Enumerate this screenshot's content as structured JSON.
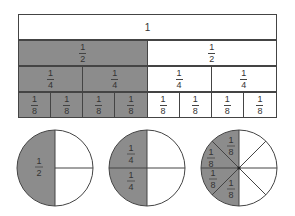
{
  "colors": {
    "shaded": "#8c8c8c",
    "unshaded": "#ffffff",
    "stroke": "#444444",
    "text": "#333333"
  },
  "fraction_bars": {
    "rows": [
      {
        "name": "whole",
        "cells": [
          {
            "label": "1",
            "shaded": false
          }
        ]
      },
      {
        "name": "halves",
        "cells": [
          {
            "num": "1",
            "den": "2",
            "shaded": true
          },
          {
            "num": "1",
            "den": "2",
            "shaded": false
          }
        ]
      },
      {
        "name": "quarters",
        "cells": [
          {
            "num": "1",
            "den": "4",
            "shaded": true
          },
          {
            "num": "1",
            "den": "4",
            "shaded": true
          },
          {
            "num": "1",
            "den": "4",
            "shaded": false
          },
          {
            "num": "1",
            "den": "4",
            "shaded": false
          }
        ]
      },
      {
        "name": "eighths",
        "cells": [
          {
            "num": "1",
            "den": "8",
            "shaded": true
          },
          {
            "num": "1",
            "den": "8",
            "shaded": true
          },
          {
            "num": "1",
            "den": "8",
            "shaded": true
          },
          {
            "num": "1",
            "den": "8",
            "shaded": true
          },
          {
            "num": "1",
            "den": "8",
            "shaded": false
          },
          {
            "num": "1",
            "den": "8",
            "shaded": false
          },
          {
            "num": "1",
            "den": "8",
            "shaded": false
          },
          {
            "num": "1",
            "den": "8",
            "shaded": false
          }
        ]
      }
    ]
  },
  "circles": [
    {
      "name": "half-circle",
      "divisions": 4,
      "shaded_label": {
        "num": "1",
        "den": "2"
      }
    },
    {
      "name": "quarter-circle",
      "divisions": 4,
      "labels": [
        {
          "num": "1",
          "den": "4"
        },
        {
          "num": "1",
          "den": "4"
        }
      ]
    },
    {
      "name": "eighth-circle",
      "divisions": 8,
      "labels": [
        {
          "num": "1",
          "den": "8"
        },
        {
          "num": "1",
          "den": "8"
        },
        {
          "num": "1",
          "den": "8"
        },
        {
          "num": "1",
          "den": "8"
        }
      ]
    }
  ]
}
